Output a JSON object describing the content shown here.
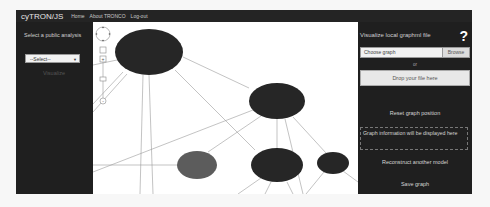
{
  "navbar": {
    "brand": "cyTRON/JS",
    "links": [
      "Home",
      "About TRONCO",
      "Log-out"
    ]
  },
  "left_panel": {
    "label": "Select a public analysis",
    "select": {
      "value": "--Select--"
    },
    "visualize_label": "Visualize"
  },
  "graph": {
    "controls": {
      "pan": "pan-control",
      "zoom_in": "+",
      "zoom_out": "-"
    },
    "nodes": [
      {
        "id": "n1",
        "cx": 56,
        "cy": 30,
        "rx": 34,
        "ry": 23,
        "color": "#262626"
      },
      {
        "id": "n2",
        "cx": 184,
        "cy": 79,
        "rx": 28,
        "ry": 18,
        "color": "#262626"
      },
      {
        "id": "n3",
        "cx": 104,
        "cy": 143,
        "rx": 20,
        "ry": 14,
        "color": "#5c5c5c"
      },
      {
        "id": "n4",
        "cx": 184,
        "cy": 143,
        "rx": 26,
        "ry": 17,
        "color": "#262626"
      },
      {
        "id": "n5",
        "cx": 240,
        "cy": 141,
        "rx": 16,
        "ry": 11,
        "color": "#262626"
      }
    ]
  },
  "right_panel": {
    "title": "Visualize local graphml file",
    "help": "?",
    "file_input": {
      "value": "Choose graph",
      "browse_label": "Browse"
    },
    "or_label": "or",
    "drop_label": "Drop your file here",
    "reset_label": "Reset graph position",
    "info_text": "Graph information will be displayed here",
    "reconstruct_label": "Reconstruct another model",
    "save_label": "Save graph"
  }
}
